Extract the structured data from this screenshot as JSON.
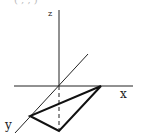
{
  "diagram": {
    "top_text": "( , , )",
    "axes": {
      "x_label": "x",
      "y_label": "y",
      "z_label": "z"
    },
    "points": {
      "origin": [
        59,
        86
      ],
      "a": [
        101,
        86
      ],
      "b": [
        30,
        116
      ],
      "c": [
        59,
        131
      ]
    }
  }
}
